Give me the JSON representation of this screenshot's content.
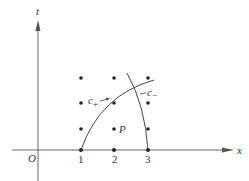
{
  "diagram": {
    "axes": {
      "x_label": "x",
      "t_label": "t",
      "origin_label": "O",
      "ticks": [
        "1",
        "2",
        "3"
      ]
    },
    "curves": [
      {
        "name": "c_plus",
        "label": "c",
        "sub": "+"
      },
      {
        "name": "c_minus",
        "label": "c",
        "sub": "−"
      }
    ],
    "point_label": "P",
    "grid_points": {
      "x": [
        1,
        2,
        3
      ],
      "t_rows": 3
    },
    "colors": {
      "ink": "#333333"
    }
  }
}
